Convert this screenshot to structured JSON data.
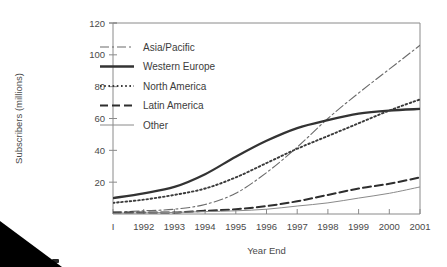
{
  "figure": {
    "background": "#ffffff",
    "ink_color": "#3a3a3a",
    "frame_color": "#8a8a8a",
    "artifact": "black-triangle-bottom-left"
  },
  "chart_data": {
    "type": "line",
    "title": "",
    "xlabel": "Year End",
    "ylabel": "Subscribers (millions)",
    "x": [
      1991,
      1992,
      1993,
      1994,
      1995,
      1996,
      1997,
      1998,
      1999,
      2000,
      2001
    ],
    "xticklabels": [
      "I",
      "1992",
      "1993",
      "1994",
      "1995",
      "1996",
      "1997",
      "1998",
      "1999",
      "2000",
      "2001"
    ],
    "yticks": [
      20,
      40,
      60,
      80,
      100,
      120
    ],
    "yticklabels": [
      "20",
      "40",
      "60",
      "80",
      "100",
      "120"
    ],
    "ylim": [
      0,
      120
    ],
    "xlim": [
      1991,
      2001
    ],
    "grid": false,
    "legend_position": "upper-left-inside",
    "series": [
      {
        "name": "Asia/Pacific",
        "style": "dashdot",
        "width": 1.1,
        "color": "#6b6b6b",
        "values": [
          1,
          2,
          3,
          6,
          13,
          26,
          42,
          60,
          76,
          91,
          106
        ]
      },
      {
        "name": "Western Europe",
        "style": "solid",
        "width": 2.3,
        "color": "#333333",
        "values": [
          10,
          13,
          17,
          25,
          36,
          46,
          54,
          59,
          63,
          65,
          66
        ]
      },
      {
        "name": "North America",
        "style": "dotted",
        "width": 1.9,
        "color": "#3a3a3a",
        "values": [
          7,
          9,
          12,
          16,
          23,
          32,
          41,
          49,
          57,
          65,
          72
        ]
      },
      {
        "name": "Latin America",
        "style": "dashed",
        "width": 2.0,
        "color": "#2e2e2e",
        "values": [
          1,
          1,
          1,
          2,
          3,
          5,
          8,
          12,
          16,
          19,
          23
        ]
      },
      {
        "name": "Other",
        "style": "solid",
        "width": 1.0,
        "color": "#8a8a8a",
        "values": [
          0.5,
          0.7,
          1,
          1.5,
          2,
          3,
          5,
          7,
          10,
          13,
          17
        ]
      }
    ]
  }
}
